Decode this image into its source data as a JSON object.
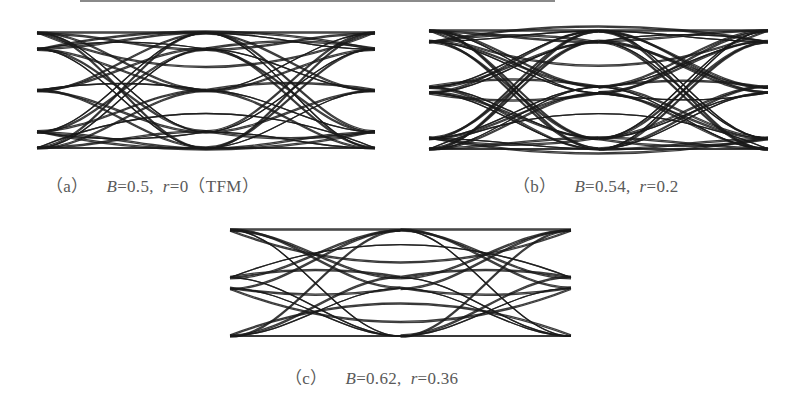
{
  "figure": {
    "panels": [
      {
        "id": "a",
        "label": "（a）",
        "B_label": "B",
        "B_value": "=0.5,",
        "r_label": "r",
        "r_value": "=0",
        "suffix": "（TFM）"
      },
      {
        "id": "b",
        "label": "（b）",
        "B_label": "B",
        "B_value": "=0.54,",
        "r_label": "r",
        "r_value": "=0.2",
        "suffix": ""
      },
      {
        "id": "c",
        "label": "（c）",
        "B_label": "B",
        "B_value": "=0.62,",
        "r_label": "r",
        "r_value": "=0.36",
        "suffix": ""
      }
    ]
  },
  "chart_data": [
    {
      "type": "line",
      "title": "(a) B=0.5, r=0 (TFM)",
      "subtitle": "Eye diagram",
      "xlabel": "",
      "ylabel": "",
      "grid": false,
      "params": {
        "B": 0.5,
        "r": 0
      },
      "levels": [
        1.0,
        0.72,
        0.0,
        -0.72,
        -1.0
      ],
      "x": [
        0,
        0.5,
        1.0,
        1.5,
        2.0
      ],
      "crossings": [
        {
          "x": 0.5,
          "y": 0.5
        },
        {
          "x": 0.5,
          "y": -0.5
        },
        {
          "x": 1.0,
          "y": 0.0
        },
        {
          "x": 1.5,
          "y": 0.5
        },
        {
          "x": 1.5,
          "y": -0.5
        }
      ]
    },
    {
      "type": "line",
      "title": "(b) B=0.54, r=0.2",
      "subtitle": "Eye diagram",
      "xlabel": "",
      "ylabel": "",
      "grid": false,
      "params": {
        "B": 0.54,
        "r": 0.2
      },
      "levels": [
        1.0,
        0.82,
        0.05,
        -0.05,
        -0.82,
        -1.0
      ],
      "x": [
        0,
        0.5,
        1.0,
        1.5,
        2.0
      ],
      "crossings": [
        {
          "x": 0.5,
          "y": 0.5
        },
        {
          "x": 0.5,
          "y": -0.5
        },
        {
          "x": 1.0,
          "y": 0.0
        },
        {
          "x": 1.5,
          "y": 0.5
        },
        {
          "x": 1.5,
          "y": -0.5
        }
      ]
    },
    {
      "type": "line",
      "title": "(c) B=0.62, r=0.36",
      "subtitle": "Eye diagram",
      "xlabel": "",
      "ylabel": "",
      "grid": false,
      "params": {
        "B": 0.62,
        "r": 0.36
      },
      "levels": [
        1.0,
        0.1,
        -0.1,
        -1.0
      ],
      "x": [
        0,
        0.5,
        1.0,
        1.5,
        2.0
      ],
      "crossings": [
        {
          "x": 0.5,
          "y": 0.55
        },
        {
          "x": 0.5,
          "y": -0.55
        },
        {
          "x": 1.0,
          "y": 0.0
        },
        {
          "x": 1.5,
          "y": 0.55
        },
        {
          "x": 1.5,
          "y": -0.55
        }
      ]
    }
  ]
}
